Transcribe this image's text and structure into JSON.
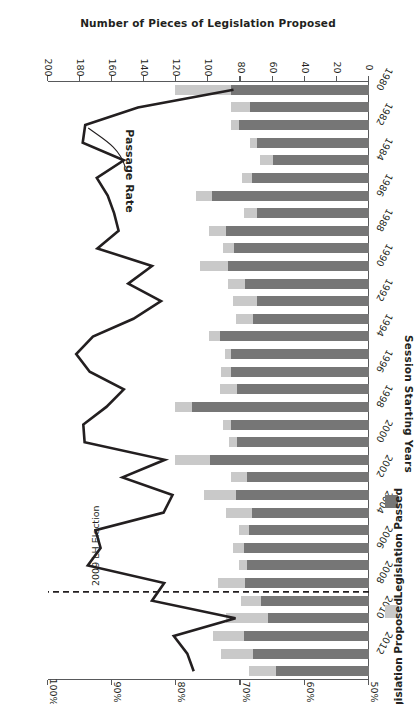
{
  "chart_data": {
    "type": "bar",
    "title": "",
    "orientation": "horizontal-stacked-with-line",
    "rotated_180": true,
    "categories": [
      1980,
      1981,
      1982,
      1983,
      1984,
      1985,
      1986,
      1987,
      1988,
      1989,
      1990,
      1991,
      1992,
      1993,
      1994,
      1995,
      1996,
      1997,
      1998,
      1999,
      2000,
      2001,
      2002,
      2003,
      2004,
      2005,
      2006,
      2007,
      2008,
      2009,
      2010,
      2011,
      2012,
      2013
    ],
    "category_tick_labels": [
      "1980",
      "1982",
      "1984",
      "1986",
      "1988",
      "1990",
      "1992",
      "1994",
      "1996",
      "1998",
      "2000",
      "2002",
      "2004",
      "2006",
      "2008",
      "2010",
      "2012"
    ],
    "bar_axis": {
      "label": "Number of Pieces of Legislation Proposed",
      "min": 0,
      "max": 200,
      "ticks": [
        0,
        20,
        40,
        60,
        80,
        100,
        120,
        140,
        160,
        180,
        200
      ],
      "tick_labels": [
        "0",
        "20",
        "40",
        "60",
        "80",
        "100",
        "120",
        "140",
        "160",
        "180",
        "200"
      ]
    },
    "line_axis": {
      "label": "Passage Rate of Proposed Legislation",
      "min": 50,
      "max": 100,
      "ticks": [
        50,
        60,
        70,
        80,
        90,
        100
      ],
      "tick_labels": [
        "50%",
        "60%",
        "70%",
        "80%",
        "90%",
        "100%"
      ]
    },
    "category_axis": {
      "label": "Session Starting Years"
    },
    "series": [
      {
        "name": "Legislation Passed",
        "color": "#767676",
        "values": [
          86,
          74,
          81,
          70,
          60,
          73,
          98,
          70,
          89,
          84,
          88,
          77,
          70,
          72,
          93,
          86,
          86,
          82,
          110,
          86,
          82,
          99,
          76,
          83,
          73,
          75,
          78,
          76,
          77,
          67,
          63,
          78,
          72,
          58
        ]
      },
      {
        "name": "Legislation Proposed",
        "note": "light segment = proposed-but-not-passed remainder; stacked on top of passed",
        "color": "#c9c9c9",
        "values": [
          35,
          12,
          5,
          4,
          8,
          6,
          10,
          8,
          11,
          7,
          17,
          11,
          15,
          11,
          7,
          4,
          6,
          11,
          11,
          5,
          5,
          22,
          10,
          20,
          16,
          6,
          7,
          5,
          17,
          13,
          26,
          19,
          20,
          17
        ]
      }
    ],
    "line_series": {
      "name": "Passage Rate",
      "color": "#231f20",
      "values": [
        71.1,
        86.0,
        94.2,
        94.6,
        88.2,
        92.4,
        90.7,
        89.7,
        89.0,
        92.3,
        83.8,
        87.5,
        82.4,
        86.7,
        93.0,
        95.6,
        93.5,
        88.2,
        90.9,
        94.5,
        94.3,
        81.8,
        88.4,
        80.6,
        82.0,
        92.6,
        91.8,
        93.8,
        81.9,
        83.8,
        70.8,
        80.4,
        78.3,
        77.3
      ]
    },
    "annotations": [
      {
        "name": "election-marker",
        "text": "2009 LH Election",
        "at_category": 2009
      },
      {
        "name": "line-callout",
        "text": "Passage Rate"
      }
    ],
    "legend": {
      "position": "left",
      "entries": [
        {
          "label": "Legislation Passed",
          "color": "#767676"
        },
        {
          "label": "Legislation Proposed",
          "color": "#c9c9c9"
        }
      ]
    },
    "grid": false,
    "colors": {
      "dark_gray": "#767676",
      "light_gray": "#c9c9c9",
      "axis": "#58595b",
      "line": "#231f20"
    }
  }
}
